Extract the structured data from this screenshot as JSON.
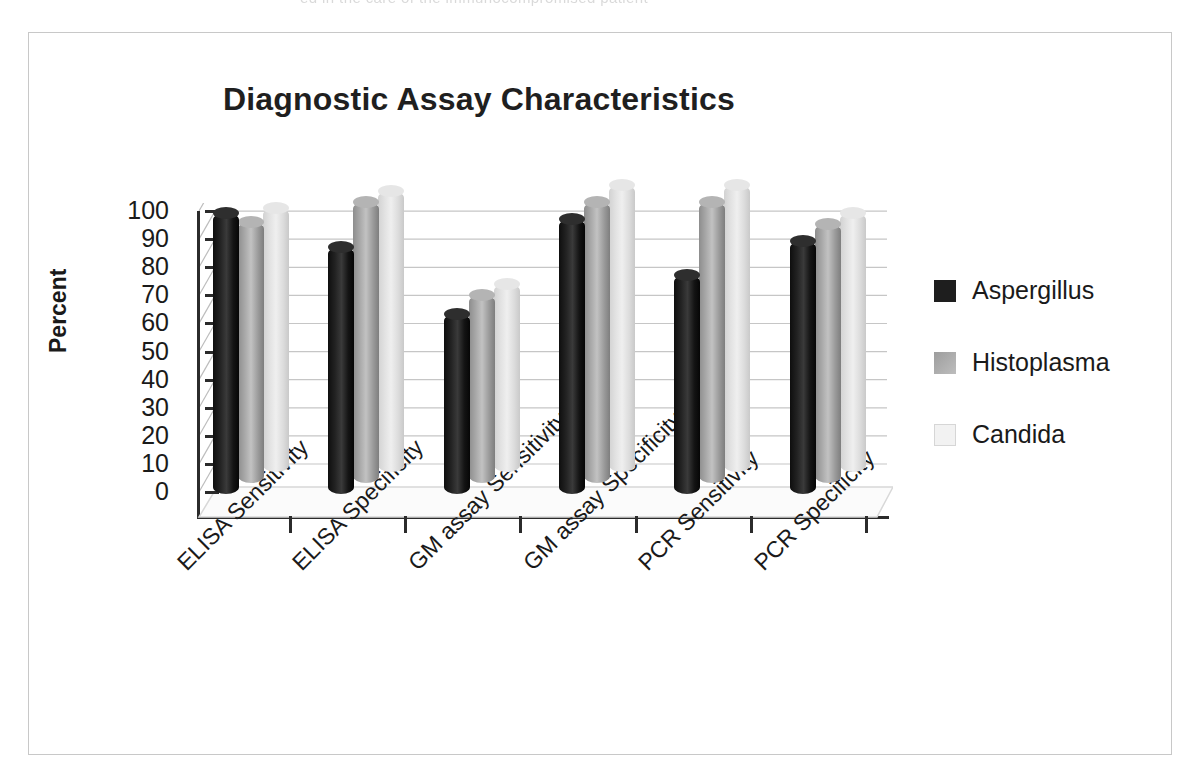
{
  "scan_artifact": {
    "top_sliver_text": "ed in the care of the immunocompromised patient"
  },
  "figure": {
    "title": "Diagnostic Assay Characteristics"
  },
  "chart_data": {
    "type": "bar",
    "title": "Diagnostic Assay Characteristics",
    "xlabel": "",
    "ylabel": "Percent",
    "ylim": [
      0,
      100
    ],
    "y_ticks": [
      "100",
      "90",
      "80",
      "70",
      "60",
      "50",
      "40",
      "30",
      "20",
      "10",
      "0"
    ],
    "grid": true,
    "legend_position": "right",
    "style": "3d-cylinder",
    "categories": [
      "ELISA Sensitivity",
      "ELISA Specificity",
      "GM assay Sensitivity",
      "GM assay Specificity",
      "PCR Sensitivity",
      "PCR Specificity"
    ],
    "series": [
      {
        "name": "Aspergillus",
        "color": "#1e1e1e",
        "values": [
          100,
          88,
          64,
          98,
          78,
          90
        ]
      },
      {
        "name": "Histoplasma",
        "color": "#a8a8a8",
        "values": [
          93,
          100,
          67,
          100,
          100,
          92
        ]
      },
      {
        "name": "Candida",
        "color": "#e6e6e6",
        "values": [
          94,
          100,
          67,
          102,
          102,
          92
        ]
      }
    ]
  },
  "legend": {
    "items": [
      {
        "label": "Aspergillus"
      },
      {
        "label": "Histoplasma"
      },
      {
        "label": "Candida"
      }
    ]
  }
}
